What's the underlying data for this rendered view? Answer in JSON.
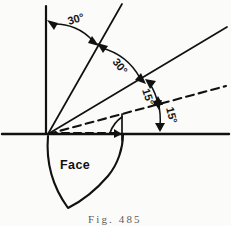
{
  "figure": {
    "caption": "Fig. 485",
    "region_label": "Face",
    "angles": [
      {
        "id": "a1",
        "value": "30°",
        "between": "vertical-and-ray-60"
      },
      {
        "id": "a2",
        "value": "30°",
        "between": "ray-60-and-ray-30"
      },
      {
        "id": "a3",
        "value": "15°",
        "between": "ray-30-and-dashed-ray-15"
      },
      {
        "id": "a4",
        "value": "15°",
        "between": "dashed-ray-15-and-horizontal"
      }
    ],
    "colors": {
      "ink": "#111111",
      "background": "#fbfbf9",
      "caption": "#5d5d5d"
    },
    "elements": {
      "vertical_axis": "vertical-reference-line",
      "horizontal_axis": "horizontal-reference-line",
      "ray_steep": "ray-60-degrees",
      "ray_mid": "ray-30-degrees",
      "ray_dashed": "dashed-ray-15-degrees",
      "face_wedge": "face-wedge-outline"
    }
  }
}
